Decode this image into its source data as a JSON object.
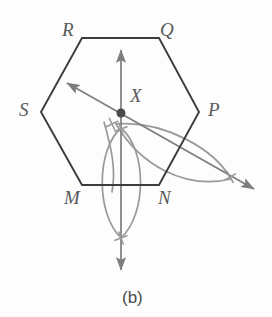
{
  "figure": {
    "caption": "(b)",
    "caption_x": 122,
    "caption_y": 289,
    "width": 272,
    "height": 317,
    "background_color": "#fdfdfd"
  },
  "colors": {
    "hexagon_stroke": "#3c3c3c",
    "construction_stroke": "#9a9a9a",
    "ray_stroke": "#7d7d7d",
    "point_fill": "#4a4a4a",
    "label_color": "#5a5a5a",
    "caption_color": "#4a4a4a"
  },
  "hexagon": {
    "name": "hexagon-MNPQRS",
    "vertices": [
      {
        "label": "R",
        "px": 82,
        "py": 38,
        "label_x": 62,
        "label_y": 20
      },
      {
        "label": "Q",
        "px": 159,
        "py": 38,
        "label_x": 160,
        "label_y": 20
      },
      {
        "label": "P",
        "px": 199,
        "py": 112,
        "label_x": 208,
        "label_y": 100
      },
      {
        "label": "N",
        "px": 159,
        "py": 185,
        "label_x": 158,
        "label_y": 188
      },
      {
        "label": "M",
        "px": 82,
        "py": 185,
        "label_x": 64,
        "label_y": 188
      },
      {
        "label": "S",
        "px": 41,
        "py": 112,
        "label_x": 19,
        "label_y": 100
      }
    ],
    "path": "M 82 38 L 159 38 L 199 112 L 159 185 L 82 185 L 41 112 Z"
  },
  "point": {
    "label": "X",
    "cx": 121,
    "cy": 113,
    "r": 4.5,
    "label_x": 130,
    "label_y": 86
  },
  "rays": [
    {
      "name": "vertical-bisector-ray",
      "x1": 121,
      "y1": 50,
      "x2": 121,
      "y2": 270,
      "arrow_start": true,
      "arrow_end": true
    },
    {
      "name": "diagonal-bisector-ray",
      "x1": 67,
      "y1": 83,
      "x2": 254,
      "y2": 189,
      "arrow_start": true,
      "arrow_end": true
    }
  ],
  "arcs": [
    {
      "name": "vesica-arc-left",
      "d": "M 121 128 C 96 150, 96 214, 121 238"
    },
    {
      "name": "vesica-arc-right",
      "d": "M 121 128 C 147 150, 147 214, 121 238"
    },
    {
      "name": "wide-arc-upper-right",
      "d": "M 116 124 C 165 120, 215 150, 231 179"
    },
    {
      "name": "wide-arc-lower-right",
      "d": "M 116 124 C 140 165, 185 190, 231 179"
    },
    {
      "name": "small-arc-near-center",
      "d": "M 104 122 C 112 150, 116 170, 112 192"
    }
  ],
  "cross_marks": [
    {
      "name": "intersection-mark-upper",
      "cx": 121,
      "cy": 129,
      "size": 9,
      "angle": 25
    },
    {
      "name": "intersection-mark-lower",
      "cx": 121,
      "cy": 238,
      "size": 9,
      "angle": 25
    },
    {
      "name": "intersection-mark-right",
      "cx": 230,
      "cy": 177,
      "size": 9,
      "angle": 15
    },
    {
      "name": "intersection-mark-left",
      "cx": 112,
      "cy": 124,
      "size": 9,
      "angle": 20
    }
  ]
}
